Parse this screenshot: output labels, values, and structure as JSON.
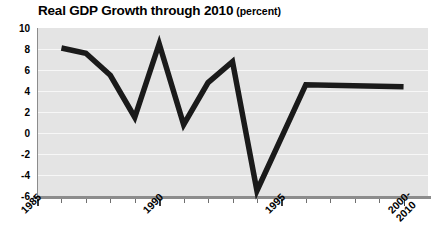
{
  "chart_data": {
    "type": "line",
    "title": "Real GDP Growth through 2010",
    "subtitle": "(percent)",
    "xlabel": "",
    "ylabel": "",
    "ylim": [
      -6,
      10
    ],
    "ytick_step": 2,
    "yticks": [
      "10",
      "8",
      "6",
      "4",
      "2",
      "0",
      "-2",
      "-4",
      "-6"
    ],
    "xticks": [
      "1985",
      "1990",
      "1995",
      "2000-\n2010"
    ],
    "xtick_labels": [
      {
        "label": "1985",
        "lines": [
          "1985"
        ]
      },
      {
        "label": "1990",
        "lines": [
          "1990"
        ]
      },
      {
        "label": "1995",
        "lines": [
          "1995"
        ]
      },
      {
        "label": "2000-2010",
        "lines": [
          "2000-",
          "2010"
        ]
      }
    ],
    "xlim": [
      1985,
      2001
    ],
    "grid": true,
    "grid_orientation": "horizontal",
    "legend": "none",
    "x": [
      1986,
      1987,
      1988,
      1989,
      1990,
      1991,
      1992,
      1993,
      1994,
      1996,
      2000
    ],
    "values": [
      8.1,
      7.6,
      5.5,
      1.5,
      8.5,
      0.8,
      4.8,
      6.8,
      -5.5,
      4.6,
      4.4
    ],
    "series": [
      {
        "name": "Real GDP Growth",
        "color": "#1a1a1a",
        "values": [
          8.1,
          7.6,
          5.5,
          1.5,
          8.5,
          0.8,
          4.8,
          6.8,
          -5.5,
          4.6,
          4.4
        ]
      }
    ]
  },
  "colors": {
    "plot_background": "#e4e4e4",
    "gridline": "#f7f7f7",
    "axis": "#8c8c8c",
    "line": "#1a1a1a",
    "page_background": "#ffffff",
    "text": "#000000"
  }
}
